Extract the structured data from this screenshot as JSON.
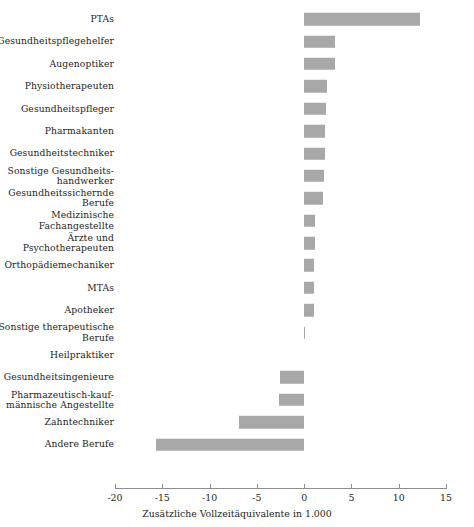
{
  "chart_data": {
    "type": "bar",
    "orientation": "horizontal",
    "title": "",
    "subtitle": "",
    "xlabel": "Zusätzliche Vollzeitäquivalente in 1.000",
    "ylabel": "",
    "xlim": [
      -20,
      15
    ],
    "xticks": [
      -20,
      -15,
      -10,
      -5,
      0,
      5,
      10,
      15
    ],
    "xticklabels": [
      "-20",
      "-15",
      "-10",
      "-5",
      "0",
      "5",
      "10",
      "15"
    ],
    "grid": false,
    "legend": null,
    "bar_color": "#a8a8a8",
    "categories": [
      "PTAs",
      "Gesundheitspflegehelfer",
      "Augenoptiker",
      "Physiotherapeuten",
      "Gesundheitspfleger",
      "Pharmakanten",
      "Gesundheitstechniker",
      "Sonstige Gesundheits-\nhandwerker",
      "Gesundheitssichernde\nBerufe",
      "Medizinische\nFachangestellte",
      "Ärzte und\nPsychotherapeuten",
      "Orthopädiemechaniker",
      "MTAs",
      "Apotheker",
      "Sonstige therapeutische\nBerufe",
      "Heilpraktiker",
      "Gesundheitsingenieure",
      "Pharmazeutisch-kauf-\nmännische Angestellte",
      "Zahntechniker",
      "Andere Berufe"
    ],
    "values": [
      12.2,
      3.3,
      3.3,
      2.4,
      2.3,
      2.2,
      2.2,
      2.1,
      2.0,
      1.2,
      1.1,
      1.0,
      1.0,
      1.0,
      0.1,
      0.0,
      -2.6,
      -2.7,
      -6.9,
      -15.7
    ]
  }
}
